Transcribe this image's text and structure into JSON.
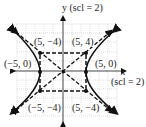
{
  "axes": {
    "y_label": "y (scl = 2)",
    "x_label": "x",
    "x_scale": "(scl = 2)"
  },
  "points": [
    {
      "label": "(5, −4)",
      "x": -5,
      "y": 4
    },
    {
      "label": "(5, 4)",
      "x": 5,
      "y": 4
    },
    {
      "label": "(−5, 0)",
      "x": -5,
      "y": 0
    },
    {
      "label": "(5, 0)",
      "x": 5,
      "y": 0
    },
    {
      "label": "(−5, −4)",
      "x": -5,
      "y": -4
    },
    {
      "label": "(5, −4)",
      "x": 5,
      "y": -4
    }
  ],
  "figure": {
    "type": "hyperbola",
    "equation": "x^2/25 - y^2/16 = 1",
    "asymptotes": [
      "y = 4x/5",
      "y = -4x/5"
    ],
    "curve_color": "#111111",
    "grid_color": "#bbbbbb"
  }
}
